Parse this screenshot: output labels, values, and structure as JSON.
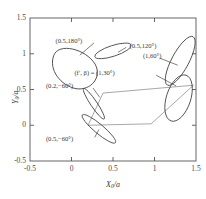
{
  "chart_data": {
    "type": "line",
    "title": "",
    "xlabel": "X0/a",
    "ylabel": "Y0/a",
    "xlim": [
      -0.5,
      1.5
    ],
    "ylim": [
      -0.5,
      1.5
    ],
    "xticks": [
      "-0.5",
      "0",
      "0.5",
      "1",
      "1.5"
    ],
    "xtick_values": [
      -0.5,
      0,
      0.5,
      1,
      1.5
    ],
    "yticks": [
      "-0.5",
      "0",
      "0.5",
      "1",
      "1.5"
    ],
    "ytick_values": [
      -0.5,
      0,
      0.5,
      1,
      1.5
    ],
    "grid": false,
    "legend": "none",
    "annotations": [
      {
        "text": "(0.5,180°)",
        "x": 0.13,
        "y": 1.17,
        "curve": "closed-loop-0.5-180"
      },
      {
        "text": "(0.5,120°)",
        "x": 0.7,
        "y": 1.1,
        "curve": "ellipse-0.5-120"
      },
      {
        "text": "(1,60°)",
        "x": 0.86,
        "y": 0.95,
        "curve": "ellipse-1-60"
      },
      {
        "text": "(f′, β) = (1,30°)",
        "x": 0.52,
        "y": 0.72,
        "curve": "ellipse-1-30"
      },
      {
        "text": "(0.2,−60°)",
        "x": 0.02,
        "y": 0.53,
        "curve": "ellipse-0.2-neg60"
      },
      {
        "text": "(0.5,−60°)",
        "x": 0.02,
        "y": -0.2,
        "curve": "ellipse-0.5-neg60"
      }
    ],
    "series": [
      {
        "name": "closed-loop-0.5-180",
        "color": "#4a4a4a",
        "shape": "teardrop",
        "cx": 0.03,
        "cy": 0.8,
        "rx": 0.3,
        "ry": 0.25,
        "angle": 25
      },
      {
        "name": "ellipse-0.5-120",
        "color": "#4a4a4a",
        "shape": "ellipse",
        "cx": 0.5,
        "cy": 1.04,
        "rx": 0.23,
        "ry": 0.075,
        "angle": -18
      },
      {
        "name": "ellipse-1-60",
        "color": "#4a4a4a",
        "shape": "ellipse",
        "cx": 1.31,
        "cy": 0.9,
        "rx": 0.33,
        "ry": 0.12,
        "angle": -62
      },
      {
        "name": "ellipse-1-30",
        "color": "#4a4a4a",
        "shape": "ellipse",
        "cx": 1.29,
        "cy": 0.38,
        "rx": 0.29,
        "ry": 0.17,
        "angle": -72
      },
      {
        "name": "ellipse-0.2-neg60",
        "color": "#4a4a4a",
        "shape": "ellipse",
        "cx": 0.27,
        "cy": 0.3,
        "rx": 0.22,
        "ry": 0.045,
        "angle": 56
      },
      {
        "name": "ellipse-0.5-neg60",
        "color": "#4a4a4a",
        "shape": "ellipse",
        "cx": 0.33,
        "cy": -0.05,
        "rx": 0.26,
        "ry": 0.065,
        "angle": 40
      },
      {
        "name": "gray-quadrilateral",
        "color": "#a8a8a8",
        "shape": "polygon",
        "points": [
          [
            0.38,
            0.45
          ],
          [
            1.47,
            0.56
          ],
          [
            0.96,
            0.02
          ],
          [
            0.2,
            0.0
          ]
        ]
      }
    ],
    "leader_lines": [
      {
        "from": [
          0.27,
          1.15
        ],
        "to": [
          0.1,
          0.98
        ],
        "name": "leader-0.5-180"
      },
      {
        "from": [
          0.66,
          1.09
        ],
        "to": [
          0.56,
          1.02
        ],
        "name": "leader-0.5-120"
      },
      {
        "from": [
          1.06,
          0.94
        ],
        "to": [
          1.28,
          0.84
        ],
        "name": "leader-1-60"
      },
      {
        "from": [
          1.02,
          0.7
        ],
        "to": [
          1.26,
          0.55
        ],
        "name": "leader-1-30"
      },
      {
        "from": [
          0.26,
          0.52
        ],
        "to": [
          0.34,
          0.39
        ],
        "name": "leader-0.2-neg60"
      },
      {
        "from": [
          0.28,
          -0.17
        ],
        "to": [
          0.33,
          -0.06
        ],
        "name": "leader-0.5-neg60"
      }
    ],
    "colors": {
      "axis": "#555555",
      "curve": "#4a4a4a",
      "polygon": "#a8a8a8",
      "text": "#3a3a3a",
      "background": "#ffffff"
    }
  }
}
